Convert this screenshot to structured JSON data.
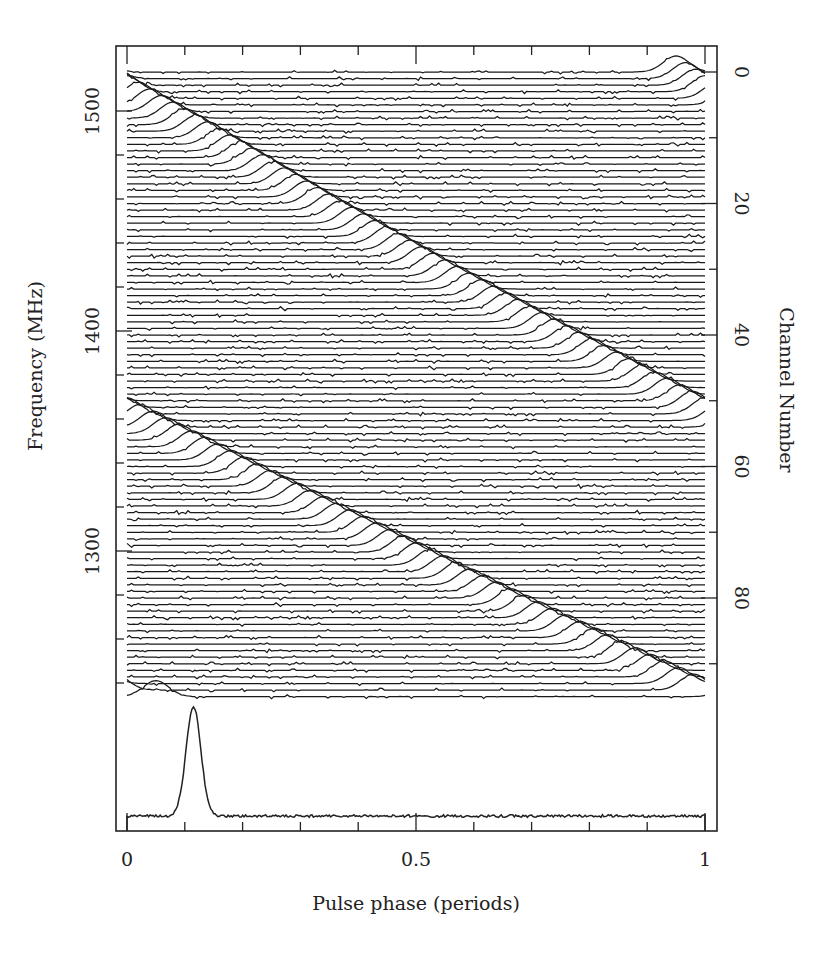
{
  "chart_data": {
    "type": "line",
    "title": "",
    "xlabel": "Pulse phase (periods)",
    "ylabel_left": "Frequency (MHz)",
    "ylabel_right": "Channel Number",
    "xlim": [
      0,
      1
    ],
    "x_ticks_major": [
      0,
      0.5,
      1
    ],
    "x_tick_labels": [
      "0",
      "0.5",
      "1"
    ],
    "x_minor_tick_step": 0.1,
    "left_axis": {
      "ticks_major": [
        1500,
        1400,
        1300
      ],
      "tick_labels": [
        "1500",
        "1400",
        "1300"
      ],
      "minor_tick_step": 20,
      "range_mhz": [
        1517.7,
        1233.6
      ]
    },
    "right_axis": {
      "ticks_major": [
        0,
        20,
        40,
        60,
        80
      ],
      "tick_labels": [
        "0",
        "20",
        "40",
        "60",
        "80"
      ],
      "minor_tick_step": 10
    },
    "grid": false,
    "legend": null,
    "channels": {
      "count": 96,
      "first_channel": 0,
      "first_frequency_mhz": 1517.7,
      "channel_width_mhz": -2.99
    },
    "dispersion_track": {
      "description": "Pulse arrival phase per channel (wraps modulo 1 period)",
      "points": [
        {
          "channel": 0,
          "phase": -0.05
        },
        {
          "channel": 3,
          "phase": 0.0
        },
        {
          "channel": 10,
          "phase": 0.14
        },
        {
          "channel": 20,
          "phase": 0.33
        },
        {
          "channel": 30,
          "phase": 0.53
        },
        {
          "channel": 40,
          "phase": 0.74
        },
        {
          "channel": 52,
          "phase": 1.0
        },
        {
          "channel": 60,
          "phase": 0.18
        },
        {
          "channel": 70,
          "phase": 0.41
        },
        {
          "channel": 80,
          "phase": 0.64
        },
        {
          "channel": 90,
          "phase": 0.88
        },
        {
          "channel": 94,
          "phase": 0.98
        },
        {
          "channel": 95,
          "phase": 0.05
        }
      ]
    },
    "integrated_profile": {
      "peak_phase": 0.115,
      "peak_relative_height": 1.0,
      "fwhm_phase": 0.03,
      "baseline": 0.0
    }
  },
  "labels": {
    "x_axis_title": "Pulse phase (periods)",
    "left_axis_title": "Frequency (MHz)",
    "right_axis_title": "Channel Number"
  }
}
